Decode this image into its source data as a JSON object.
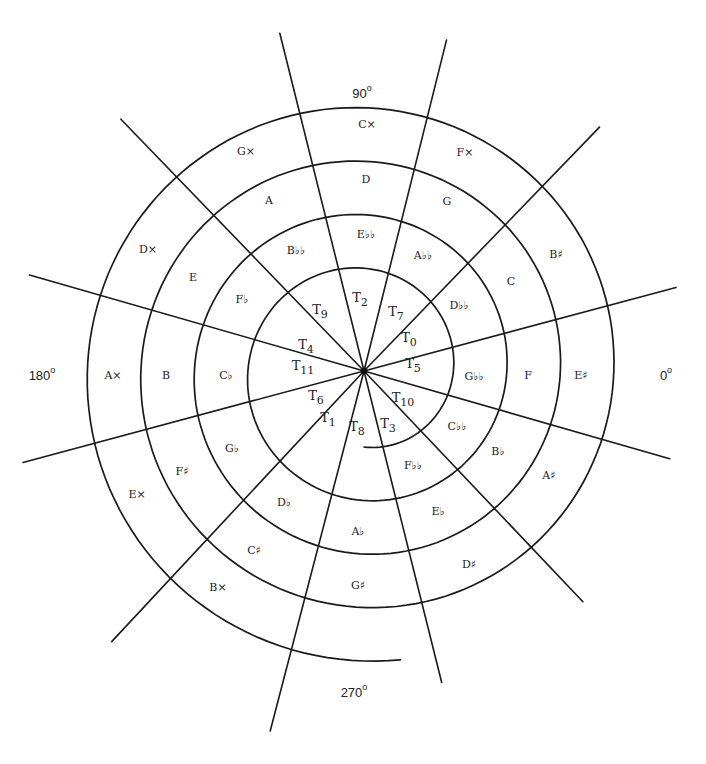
{
  "figure": {
    "center": [
      364,
      371
    ],
    "spiral": {
      "start_angle_deg": 270,
      "start_radius": 76,
      "growth_per_turn": 53.5,
      "turns": 4.02,
      "direction": "counterclockwise"
    },
    "radial_lines": [
      {
        "angle": 104,
        "length": 348
      },
      {
        "angle": 76,
        "length": 341
      },
      {
        "angle": 46,
        "length": 339
      },
      {
        "angle": 15,
        "length": 323
      },
      {
        "angle": -16,
        "length": 318
      },
      {
        "angle": -46.5,
        "length": 318
      },
      {
        "angle": -76,
        "length": 321
      },
      {
        "angle": -104.6,
        "length": 372
      },
      {
        "angle": -133,
        "length": 370
      },
      {
        "angle": -165,
        "length": 353
      },
      {
        "angle": 164,
        "length": 348
      },
      {
        "angle": 134,
        "length": 350
      }
    ],
    "degree_labels": [
      {
        "text": "90",
        "x": 362,
        "y": 95
      },
      {
        "text": "0",
        "x": 666,
        "y": 377
      },
      {
        "text": "180",
        "x": 42,
        "y": 377
      },
      {
        "text": "270",
        "x": 354,
        "y": 694
      }
    ],
    "transposition_labels": [
      {
        "text": "T",
        "sub": "0",
        "x": 409,
        "y": 338
      },
      {
        "text": "T",
        "sub": "5",
        "x": 413,
        "y": 364
      },
      {
        "text": "T",
        "sub": "10",
        "x": 403,
        "y": 398
      },
      {
        "text": "T",
        "sub": "3",
        "x": 388,
        "y": 424
      },
      {
        "text": "T",
        "sub": "8",
        "x": 357,
        "y": 427
      },
      {
        "text": "T",
        "sub": "1",
        "x": 328,
        "y": 418
      },
      {
        "text": "T",
        "sub": "6",
        "x": 316,
        "y": 396
      },
      {
        "text": "T",
        "sub": "11",
        "x": 303,
        "y": 366
      },
      {
        "text": "T",
        "sub": "4",
        "x": 306,
        "y": 345
      },
      {
        "text": "T",
        "sub": "9",
        "x": 320,
        "y": 310
      },
      {
        "text": "T",
        "sub": "2",
        "x": 360,
        "y": 298
      },
      {
        "text": "T",
        "sub": "7",
        "x": 396,
        "y": 312
      }
    ],
    "note_labels": [
      {
        "text": "D♭♭",
        "x": 459,
        "y": 306
      },
      {
        "text": "G♭♭",
        "x": 474,
        "y": 377
      },
      {
        "text": "C♭♭",
        "x": 457,
        "y": 427
      },
      {
        "text": "F♭♭",
        "x": 413,
        "y": 466
      },
      {
        "text": "A♭♭",
        "x": 423,
        "y": 256
      },
      {
        "text": "E♭♭",
        "x": 366,
        "y": 235
      },
      {
        "text": "B♭♭",
        "x": 296,
        "y": 251
      },
      {
        "text": "F♭",
        "x": 242,
        "y": 300
      },
      {
        "text": "C♭",
        "x": 226,
        "y": 376
      },
      {
        "text": "G♭",
        "x": 232,
        "y": 449
      },
      {
        "text": "D♭",
        "x": 284,
        "y": 503
      },
      {
        "text": "A♭",
        "x": 358,
        "y": 532
      },
      {
        "text": "E♭",
        "x": 438,
        "y": 512
      },
      {
        "text": "B♭",
        "x": 498,
        "y": 452
      },
      {
        "text": "F",
        "x": 528,
        "y": 376
      },
      {
        "text": "C",
        "x": 511,
        "y": 282
      },
      {
        "text": "G",
        "x": 447,
        "y": 202
      },
      {
        "text": "D",
        "x": 366,
        "y": 180
      },
      {
        "text": "A",
        "x": 269,
        "y": 201
      },
      {
        "text": "E",
        "x": 193,
        "y": 278
      },
      {
        "text": "B",
        "x": 166,
        "y": 376
      },
      {
        "text": "F♯",
        "x": 182,
        "y": 472
      },
      {
        "text": "C♯",
        "x": 254,
        "y": 551
      },
      {
        "text": "G♯",
        "x": 358,
        "y": 586
      },
      {
        "text": "D♯",
        "x": 469,
        "y": 565
      },
      {
        "text": "A♯",
        "x": 549,
        "y": 476
      },
      {
        "text": "E♯",
        "x": 581,
        "y": 376
      },
      {
        "text": "B♯",
        "x": 556,
        "y": 255
      },
      {
        "text": "F×",
        "x": 465,
        "y": 153
      },
      {
        "text": "C×",
        "x": 367,
        "y": 125
      },
      {
        "text": "G×",
        "x": 246,
        "y": 152
      },
      {
        "text": "D×",
        "x": 148,
        "y": 250
      },
      {
        "text": "A×",
        "x": 113,
        "y": 376
      },
      {
        "text": "E×",
        "x": 137,
        "y": 495
      },
      {
        "text": "B×",
        "x": 218,
        "y": 588
      }
    ]
  }
}
